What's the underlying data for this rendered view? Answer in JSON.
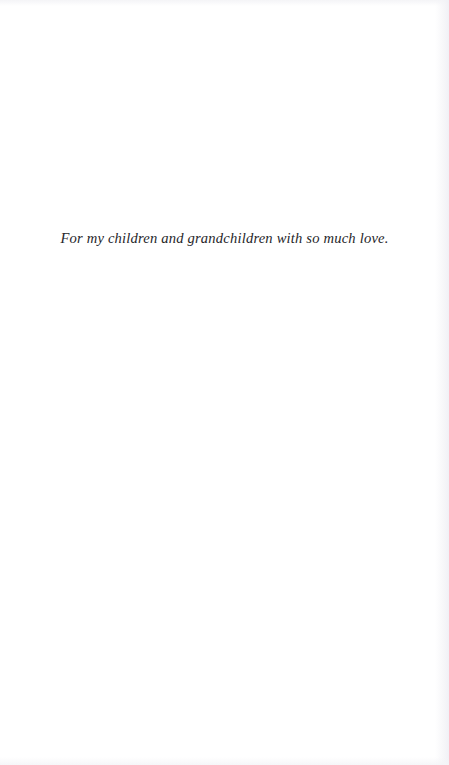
{
  "page": {
    "kind": "book-dedication-page",
    "width": 449,
    "height": 765,
    "background_color": "#ffffff",
    "text_color": "#26262a"
  },
  "dedication": {
    "text": "For my children and grandchildren with so much love."
  }
}
